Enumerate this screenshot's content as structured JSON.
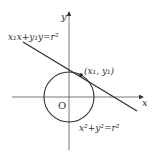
{
  "diagram": {
    "axes": {
      "x_label": "x",
      "y_label": "y",
      "origin_label": "O"
    },
    "circle": {
      "equation": "x²+y²=r²",
      "equation_parts": {
        "a": "x",
        "b": "+y",
        "c": "=r",
        "sup": "2"
      }
    },
    "tangent_line": {
      "equation": "x₁x+y₁y=r²"
    },
    "tangent_point": {
      "label": "(x₁, y₁)"
    },
    "colors": {
      "stroke": "#333333",
      "background": "#ffffff"
    }
  }
}
